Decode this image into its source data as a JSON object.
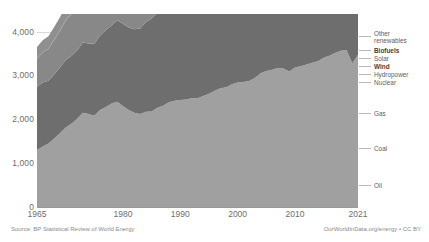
{
  "meta": {
    "clipped_top_text": "",
    "background": "#ffffff"
  },
  "footer": {
    "source": "Source: BP Statistical Review of World Energy",
    "credit": "OurWorldInData.org/energy • CC BY"
  },
  "legend": {
    "items": [
      {
        "label": "Other renewables",
        "key": "other_renewables",
        "color": "#c9c9c9",
        "bold": false,
        "y": 33,
        "two_line": true
      },
      {
        "label": "Biofuels",
        "key": "biofuels",
        "color": "#b4b4b4",
        "bold": true,
        "y": 47,
        "two_line": false
      },
      {
        "label": "Solar",
        "key": "solar",
        "color": "#a8a8a8",
        "bold": false,
        "y": 55,
        "two_line": false
      },
      {
        "label": "Wind",
        "key": "wind",
        "color": "#9d9d9d",
        "bold": true,
        "y": 63,
        "two_line": false
      },
      {
        "label": "Hydropower",
        "key": "hydropower",
        "color": "#8f8f8f",
        "bold": false,
        "y": 71,
        "two_line": false
      },
      {
        "label": "Nuclear",
        "key": "nuclear",
        "color": "#7f7f7f",
        "bold": false,
        "y": 79,
        "two_line": false
      },
      {
        "label": "Gas",
        "key": "gas",
        "color": "#888888",
        "bold": false,
        "y": 110,
        "two_line": false
      },
      {
        "label": "Coal",
        "key": "coal",
        "color": "#6e6e6e",
        "bold": false,
        "y": 145,
        "two_line": false
      },
      {
        "label": "Oil",
        "key": "oil",
        "color": "#a0a0a0",
        "bold": false,
        "y": 182,
        "two_line": false
      }
    ]
  },
  "chart_data": {
    "type": "area",
    "stacked": true,
    "title": "",
    "xlabel": "",
    "ylabel": "",
    "xlim": [
      1965,
      2021
    ],
    "ylim": [
      0,
      4400
    ],
    "grid": true,
    "legend_position": "right-inline",
    "ytick_values": [
      0,
      1000,
      2000,
      3000,
      4000
    ],
    "ytick_labels": [
      "0",
      "1,000",
      "2,000",
      "3,000",
      "4,000"
    ],
    "xtick_values": [
      1965,
      1980,
      1990,
      2000,
      2010,
      2021
    ],
    "xtick_labels": [
      "1965",
      "1980",
      "1990",
      "2000",
      "2010",
      "2021"
    ],
    "x": [
      1965,
      1966,
      1967,
      1968,
      1969,
      1970,
      1971,
      1972,
      1973,
      1974,
      1975,
      1976,
      1977,
      1978,
      1979,
      1980,
      1981,
      1982,
      1983,
      1984,
      1985,
      1986,
      1987,
      1988,
      1989,
      1990,
      1991,
      1992,
      1993,
      1994,
      1995,
      1996,
      1997,
      1998,
      1999,
      2000,
      2001,
      2002,
      2003,
      2004,
      2005,
      2006,
      2007,
      2008,
      2009,
      2010,
      2011,
      2012,
      2013,
      2014,
      2015,
      2016,
      2017,
      2018,
      2019,
      2020,
      2021
    ],
    "series": [
      {
        "name": "Oil",
        "color": "#a0a0a0",
        "values": [
          1300,
          1380,
          1450,
          1560,
          1680,
          1810,
          1900,
          2010,
          2150,
          2120,
          2080,
          2210,
          2280,
          2360,
          2400,
          2300,
          2210,
          2150,
          2120,
          2170,
          2180,
          2260,
          2310,
          2390,
          2420,
          2440,
          2450,
          2480,
          2480,
          2530,
          2580,
          2650,
          2710,
          2730,
          2800,
          2840,
          2850,
          2870,
          2940,
          3050,
          3100,
          3130,
          3170,
          3160,
          3090,
          3180,
          3210,
          3250,
          3290,
          3320,
          3400,
          3450,
          3510,
          3560,
          3580,
          3280,
          3470
        ]
      },
      {
        "name": "Coal",
        "color": "#6e6e6e",
        "values": [
          1440,
          1460,
          1430,
          1460,
          1500,
          1540,
          1540,
          1560,
          1600,
          1610,
          1640,
          1700,
          1750,
          1780,
          1860,
          1880,
          1880,
          1900,
          1950,
          2040,
          2120,
          2160,
          2230,
          2300,
          2330,
          2330,
          2310,
          2290,
          2290,
          2300,
          2360,
          2400,
          2410,
          2390,
          2390,
          2420,
          2460,
          2540,
          2750,
          2950,
          3110,
          3250,
          3420,
          3510,
          3490,
          3690,
          3940,
          4030,
          4090,
          4090,
          4000,
          3930,
          3960,
          4030,
          4020,
          3900,
          4070
        ]
      },
      {
        "name": "Gas",
        "color": "#888888",
        "values": [
          640,
          680,
          720,
          780,
          830,
          890,
          950,
          1000,
          1040,
          1060,
          1050,
          1110,
          1130,
          1170,
          1240,
          1240,
          1240,
          1230,
          1240,
          1320,
          1360,
          1380,
          1450,
          1510,
          1570,
          1600,
          1630,
          1640,
          1670,
          1680,
          1740,
          1830,
          1830,
          1860,
          1910,
          1990,
          2020,
          2070,
          2130,
          2200,
          2260,
          2320,
          2400,
          2440,
          2380,
          2560,
          2620,
          2690,
          2750,
          2770,
          2830,
          2900,
          3000,
          3110,
          3170,
          3140,
          3270
        ]
      },
      {
        "name": "Nuclear",
        "color": "#7f7f7f",
        "values": [
          8,
          10,
          13,
          17,
          22,
          25,
          32,
          44,
          54,
          73,
          101,
          117,
          140,
          164,
          165,
          182,
          212,
          219,
          250,
          299,
          353,
          378,
          411,
          441,
          459,
          473,
          485,
          489,
          500,
          510,
          521,
          530,
          535,
          545,
          561,
          570,
          574,
          580,
          578,
          586,
          592,
          591,
          593,
          589,
          582,
          598,
          560,
          525,
          524,
          536,
          543,
          557,
          564,
          581,
          603,
          587,
          622
        ]
      },
      {
        "name": "Hydropower",
        "color": "#8f8f8f",
        "values": [
          262,
          272,
          280,
          289,
          296,
          307,
          313,
          319,
          329,
          347,
          353,
          350,
          364,
          382,
          392,
          403,
          406,
          416,
          436,
          447,
          450,
          458,
          460,
          467,
          472,
          485,
          490,
          494,
          503,
          507,
          525,
          537,
          540,
          551,
          558,
          570,
          552,
          559,
          570,
          595,
          600,
          620,
          620,
          650,
          660,
          690,
          700,
          720,
          760,
          780,
          790,
          800,
          820,
          830,
          840,
          860,
          880
        ]
      },
      {
        "name": "Wind",
        "color": "#9d9d9d",
        "values": [
          0,
          0,
          0,
          0,
          0,
          0,
          0,
          0,
          0,
          0,
          0,
          0,
          0,
          0,
          0,
          0,
          0,
          0,
          0,
          0,
          0,
          0,
          0,
          0,
          0,
          1,
          1,
          1,
          2,
          2,
          3,
          3,
          4,
          5,
          6,
          8,
          9,
          11,
          14,
          18,
          23,
          28,
          36,
          47,
          58,
          74,
          93,
          110,
          131,
          155,
          180,
          205,
          240,
          275,
          310,
          350,
          410
        ]
      },
      {
        "name": "Solar",
        "color": "#a8a8a8",
        "values": [
          0,
          0,
          0,
          0,
          0,
          0,
          0,
          0,
          0,
          0,
          0,
          0,
          0,
          0,
          0,
          0,
          0,
          0,
          0,
          0,
          0,
          0,
          0,
          0,
          0,
          0,
          0,
          0,
          0,
          0,
          0,
          0,
          0,
          0,
          0,
          0,
          0,
          0,
          0,
          1,
          1,
          2,
          3,
          4,
          6,
          9,
          15,
          22,
          33,
          46,
          60,
          78,
          102,
          130,
          165,
          200,
          255
        ]
      },
      {
        "name": "Biofuels",
        "color": "#b4b4b4",
        "values": [
          0,
          0,
          0,
          0,
          0,
          0,
          0,
          0,
          0,
          0,
          0,
          0,
          0,
          0,
          0,
          1,
          1,
          2,
          3,
          4,
          5,
          6,
          7,
          8,
          9,
          10,
          11,
          12,
          13,
          14,
          16,
          18,
          19,
          20,
          22,
          25,
          27,
          30,
          35,
          42,
          50,
          62,
          75,
          90,
          98,
          110,
          118,
          120,
          128,
          138,
          142,
          148,
          155,
          162,
          168,
          155,
          165
        ]
      },
      {
        "name": "Other renewables",
        "color": "#c9c9c9",
        "values": [
          1,
          1,
          2,
          2,
          3,
          3,
          4,
          4,
          5,
          6,
          7,
          8,
          9,
          11,
          12,
          14,
          16,
          18,
          21,
          24,
          27,
          31,
          35,
          40,
          45,
          50,
          54,
          58,
          62,
          67,
          72,
          78,
          84,
          89,
          95,
          101,
          106,
          112,
          120,
          128,
          137,
          147,
          158,
          170,
          180,
          192,
          205,
          218,
          232,
          246,
          258,
          270,
          284,
          298,
          312,
          322,
          340
        ]
      }
    ]
  }
}
